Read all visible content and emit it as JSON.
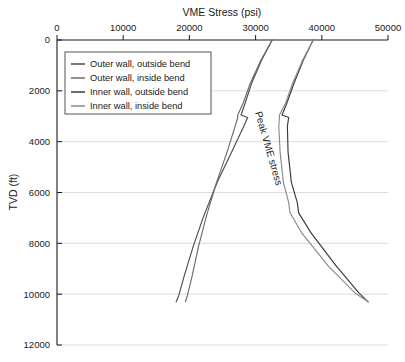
{
  "chart_data": {
    "type": "line",
    "title": "VME Stress (psi)",
    "xlabel": "VME Stress (psi)",
    "ylabel": "TVD (ft)",
    "xlim": [
      0,
      50000
    ],
    "ylim": [
      0,
      12000
    ],
    "y_inverted": true,
    "grid": true,
    "legend_position": "top-left",
    "xticks": [
      0,
      10000,
      20000,
      30000,
      40000,
      50000
    ],
    "xtick_labels": [
      "0",
      "10000",
      "20000",
      "30000",
      "40000",
      "50000"
    ],
    "yticks": [
      0,
      2000,
      4000,
      6000,
      8000,
      10000,
      12000
    ],
    "ytick_labels": [
      "0",
      "2000",
      "4000",
      "6000",
      "8000",
      "10000",
      "12000"
    ],
    "annotations": [
      {
        "text": "Peak VME stress",
        "x": 31500,
        "y": 4300,
        "rotation": 74
      }
    ],
    "series": [
      {
        "name": "Outer wall, outside bend",
        "color": "#4d4d4d",
        "x": [
          32500,
          30900,
          29400,
          28400,
          27800,
          28800,
          28200,
          26400,
          24200,
          22200,
          20600,
          19200,
          18400,
          18000
        ],
        "y": [
          0,
          800,
          1700,
          2500,
          2950,
          3050,
          3400,
          4400,
          5600,
          6900,
          8100,
          9300,
          10050,
          10300
        ]
      },
      {
        "name": "Outer wall, inside bend",
        "color": "#6b6b6b",
        "x": [
          32500,
          30800,
          29200,
          28100,
          27300,
          27300,
          26900,
          25700,
          24100,
          22600,
          21400,
          20400,
          19700,
          19400
        ],
        "y": [
          0,
          800,
          1700,
          2500,
          2950,
          3050,
          3400,
          4400,
          5600,
          6900,
          8100,
          9300,
          10050,
          10300
        ]
      },
      {
        "name": "Inner wall, outside bend",
        "color": "#3a3a3a",
        "x": [
          38700,
          37200,
          35800,
          34700,
          34000,
          35000,
          34800,
          34900,
          35400,
          36300,
          36500,
          38400,
          42200,
          45600,
          47000
        ],
        "y": [
          0,
          800,
          1700,
          2500,
          2950,
          3050,
          3400,
          4400,
          5600,
          6400,
          6800,
          7600,
          8900,
          9950,
          10300
        ]
      },
      {
        "name": "Inner wall, inside bend",
        "color": "#8a8a8a",
        "x": [
          38700,
          37100,
          35600,
          34500,
          33600,
          33600,
          33500,
          33700,
          34200,
          35000,
          35200,
          37000,
          41000,
          45000,
          47000
        ],
        "y": [
          0,
          800,
          1700,
          2500,
          2950,
          3050,
          3400,
          4400,
          5600,
          6400,
          6800,
          7600,
          8900,
          9950,
          10300
        ]
      }
    ]
  },
  "legend": {
    "items": [
      {
        "label": "Outer wall, outside bend"
      },
      {
        "label": "Outer wall, inside bend"
      },
      {
        "label": "Inner wall, outside bend"
      },
      {
        "label": "Inner wall, inside bend"
      }
    ]
  },
  "colors": {
    "axis": "#1a1a1a",
    "grid": "#dddddd",
    "background": "#ffffff",
    "legend_border": "#555555"
  }
}
